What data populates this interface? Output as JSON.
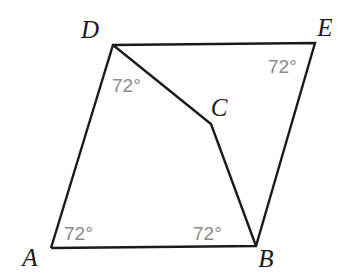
{
  "figure": {
    "background_color": "#ffffff",
    "stroke_color": "#1a1a1a",
    "angle_label_color": "#8a8a8a",
    "vertex_label_color": "#1a1a1a",
    "vertices": [
      {
        "id": "A",
        "label": "A",
        "x": 51,
        "y": 248,
        "label_x": 30,
        "label_y": 266
      },
      {
        "id": "B",
        "label": "B",
        "x": 256,
        "y": 246,
        "label_x": 266,
        "label_y": 267
      },
      {
        "id": "C",
        "label": "C",
        "x": 211,
        "y": 124,
        "label_x": 219,
        "label_y": 116
      },
      {
        "id": "D",
        "label": "D",
        "x": 113,
        "y": 45,
        "label_x": 90,
        "label_y": 38
      },
      {
        "id": "E",
        "label": "E",
        "x": 315,
        "y": 43,
        "label_x": 325,
        "label_y": 36
      }
    ],
    "segments": [
      {
        "name": "side-A-D",
        "from": "A",
        "to": "D"
      },
      {
        "name": "side-D-E",
        "from": "D",
        "to": "E"
      },
      {
        "name": "side-E-B",
        "from": "E",
        "to": "B"
      },
      {
        "name": "side-B-A",
        "from": "B",
        "to": "A"
      },
      {
        "name": "segment-D-C",
        "from": "D",
        "to": "C"
      },
      {
        "name": "segment-C-B",
        "from": "C",
        "to": "B"
      }
    ],
    "angles": [
      {
        "name": "angle-at-D",
        "at": "D",
        "text": "72°",
        "x": 112,
        "y": 92
      },
      {
        "name": "angle-at-E",
        "at": "E",
        "text": "72°",
        "x": 268,
        "y": 73
      },
      {
        "name": "angle-at-A",
        "at": "A",
        "text": "72°",
        "x": 64,
        "y": 240
      },
      {
        "name": "angle-at-B",
        "at": "B",
        "text": "72°",
        "x": 193,
        "y": 240
      }
    ]
  }
}
